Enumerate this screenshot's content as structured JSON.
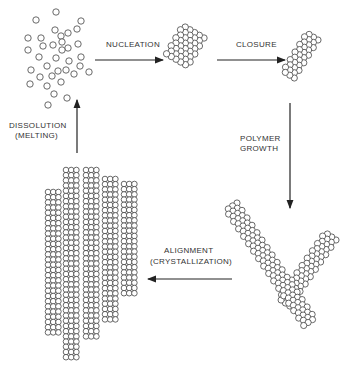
{
  "diagram": {
    "type": "cycle",
    "stages": [
      {
        "id": "monomers",
        "description": "dispersed monomer subunits"
      },
      {
        "id": "nucleus",
        "description": "small helical nucleus"
      },
      {
        "id": "closed-polymer",
        "description": "closed tubular polymer segment"
      },
      {
        "id": "grown-polymers",
        "description": "two elongated polymer rods"
      },
      {
        "id": "crystal",
        "description": "aligned bundle of polymer rods"
      }
    ],
    "transitions": [
      {
        "from": "monomers",
        "to": "nucleus",
        "label": "NUCLEATION"
      },
      {
        "from": "nucleus",
        "to": "closed-polymer",
        "label": "CLOSURE"
      },
      {
        "from": "closed-polymer",
        "to": "grown-polymers",
        "label_line1": "POLYMER",
        "label_line2": "GROWTH"
      },
      {
        "from": "grown-polymers",
        "to": "crystal",
        "label_line1": "ALIGNMENT",
        "label_line2": "(CRYSTALLIZATION)"
      },
      {
        "from": "crystal",
        "to": "monomers",
        "label_line1": "DISSOLUTION",
        "label_line2": "(MELTING)"
      }
    ]
  },
  "labels": {
    "nucleation": "NUCLEATION",
    "closure": "CLOSURE",
    "polymer_growth_1": "POLYMER",
    "polymer_growth_2": "GROWTH",
    "alignment_1": "ALIGNMENT",
    "alignment_2": "(CRYSTALLIZATION)",
    "dissolution_1": "DISSOLUTION",
    "dissolution_2": "(MELTING)"
  },
  "colors": {
    "stroke": "#444444",
    "background": "#ffffff"
  }
}
